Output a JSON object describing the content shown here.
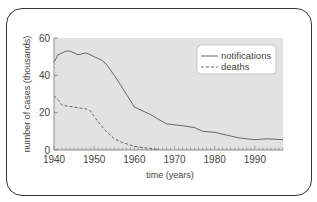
{
  "chart_data": {
    "type": "line",
    "title": "",
    "xlabel": "time (years)",
    "ylabel": "number of cases (thousands)",
    "xlim": [
      1940,
      1997
    ],
    "ylim": [
      0,
      60
    ],
    "xticks": [
      1940,
      1950,
      1960,
      1970,
      1980,
      1990
    ],
    "yticks": [
      0,
      20,
      40,
      60
    ],
    "grid": false,
    "legend_position": "upper right",
    "series": [
      {
        "name": "notifications",
        "style": "solid",
        "x": [
          1940,
          1941,
          1943,
          1944,
          1946,
          1948,
          1950,
          1952,
          1953,
          1955,
          1958,
          1960,
          1964,
          1968,
          1972,
          1975,
          1977,
          1980,
          1983,
          1986,
          1988,
          1990,
          1993,
          1997
        ],
        "values": [
          47,
          51,
          53,
          53,
          51,
          52,
          50,
          48,
          46,
          40,
          30,
          23,
          19,
          14,
          13,
          12,
          10,
          9.5,
          8,
          6.5,
          6,
          5.5,
          6,
          5.5
        ]
      },
      {
        "name": "deaths",
        "style": "dashed",
        "x": [
          1940,
          1941,
          1942,
          1945,
          1948,
          1949,
          1951,
          1953,
          1955,
          1957,
          1960,
          1963,
          1966
        ],
        "values": [
          29,
          27,
          24,
          23,
          22,
          21,
          15,
          10,
          6,
          4,
          2,
          1,
          0.3
        ]
      }
    ]
  },
  "legend": {
    "items": [
      "notifications",
      "deaths"
    ]
  },
  "axes": {
    "x_title": "time (years)",
    "y_title": "number of cases (thousands)",
    "x_tick_labels": [
      "1940",
      "1950",
      "1960",
      "1970",
      "1980",
      "1990"
    ],
    "y_tick_labels": [
      "0",
      "20",
      "40",
      "60"
    ]
  },
  "colors": {
    "plot_bg": "#e2e2e2",
    "line": "#666666",
    "frame": "#333333"
  }
}
